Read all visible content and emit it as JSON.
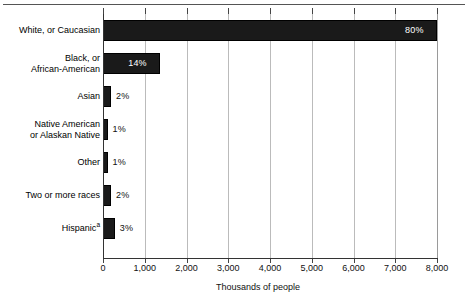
{
  "chart_data": {
    "type": "bar",
    "orientation": "horizontal",
    "title": "",
    "xlabel": "Thousands of people",
    "ylabel": "",
    "xlim": [
      0,
      8000
    ],
    "xticks": [
      0,
      1000,
      2000,
      3000,
      4000,
      5000,
      6000,
      7000,
      8000
    ],
    "xticklabels": [
      "0",
      "1,000",
      "2,000",
      "3,000",
      "4,000",
      "5,000",
      "6,000",
      "7,000",
      "8,000"
    ],
    "grid": "vertical",
    "legend": "none",
    "categories": [
      "White, or Caucasian",
      "Black, or\nAfrican-American",
      "Asian",
      "Native American\nor Alaskan Native",
      "Other",
      "Two or more races",
      "Hispanic"
    ],
    "values": [
      8000,
      1370,
      190,
      110,
      110,
      190,
      280
    ],
    "data_labels": [
      "80%",
      "14%",
      "2%",
      "1%",
      "1%",
      "2%",
      "3%"
    ],
    "label_inside": [
      true,
      true,
      false,
      false,
      false,
      false,
      false
    ],
    "footnote_markers": [
      "",
      "",
      "",
      "",
      "",
      "",
      "a"
    ],
    "bar_color": "#1a1a1a",
    "grid_color": "#bbbbbb",
    "axis_color": "#333333"
  },
  "xticklabels": [
    {
      "label": "0",
      "value": 0
    },
    {
      "label": "1,000",
      "value": 1000
    },
    {
      "label": "2,000",
      "value": 2000
    },
    {
      "label": "3,000",
      "value": 3000
    },
    {
      "label": "4,000",
      "value": 4000
    },
    {
      "label": "5,000",
      "value": 5000
    },
    {
      "label": "6,000",
      "value": 6000
    },
    {
      "label": "7,000",
      "value": 7000
    },
    {
      "label": "8,000",
      "value": 8000
    }
  ],
  "rows": [
    {
      "label": "White, or Caucasian",
      "pct": "80%",
      "value": 8000,
      "inside": true,
      "sup": ""
    },
    {
      "label": "Black, or\nAfrican-American",
      "pct": "14%",
      "value": 1370,
      "inside": true,
      "sup": ""
    },
    {
      "label": "Asian",
      "pct": "2%",
      "value": 190,
      "inside": false,
      "sup": ""
    },
    {
      "label": "Native American\nor Alaskan Native",
      "pct": "1%",
      "value": 110,
      "inside": false,
      "sup": ""
    },
    {
      "label": "Other",
      "pct": "1%",
      "value": 110,
      "inside": false,
      "sup": ""
    },
    {
      "label": "Two or more races",
      "pct": "2%",
      "value": 190,
      "inside": false,
      "sup": ""
    },
    {
      "label": "Hispanic",
      "pct": "3%",
      "value": 280,
      "inside": false,
      "sup": "a"
    }
  ],
  "axis_title": "Thousands of people"
}
